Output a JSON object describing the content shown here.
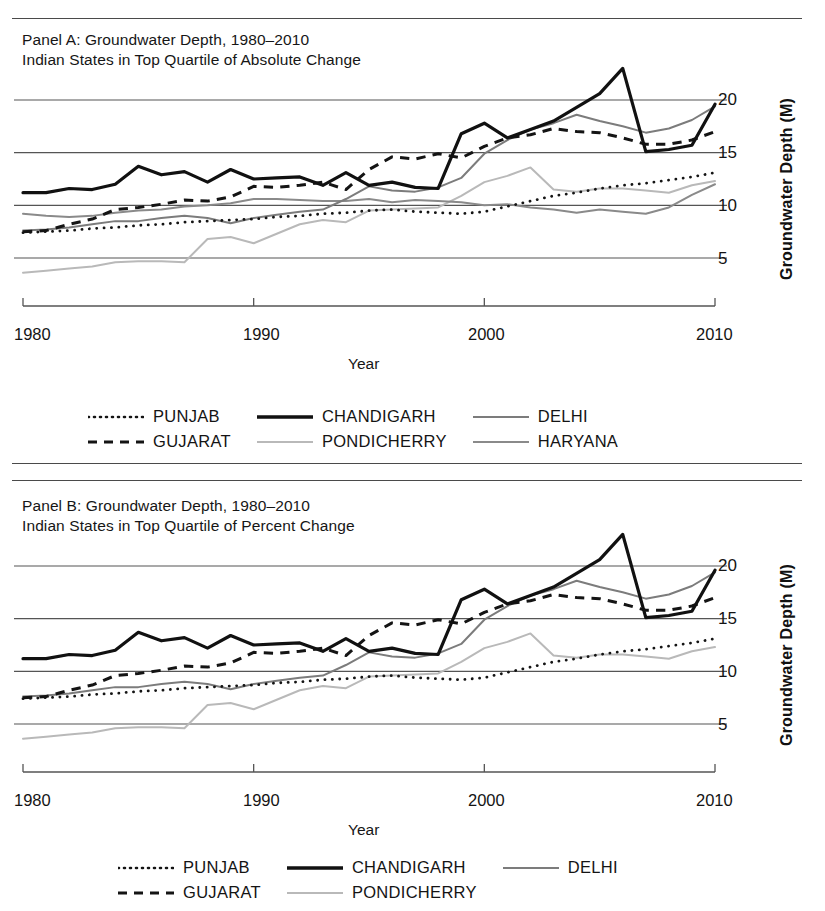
{
  "figure": {
    "ylabel": "Groundwater Depth (M)",
    "xlabel": "Year",
    "xticks": [
      "1980",
      "1990",
      "2000",
      "2010"
    ],
    "yticks": [
      "5",
      "10",
      "15",
      "20"
    ]
  },
  "panels": [
    {
      "id": "panel-a",
      "title_line1": "Panel A: Groundwater Depth, 1980–2010",
      "title_line2": "Indian States in Top Quartile of Absolute Change",
      "ylabel": "Groundwater Depth (M)",
      "xlabel": "Year",
      "legend": [
        {
          "label": "PUNJAB",
          "style": "dotted",
          "color": "#141414",
          "width": 2.6
        },
        {
          "label": "GUJARAT",
          "style": "dashed",
          "color": "#141414",
          "width": 3.0
        },
        {
          "label": "CHANDIGARH",
          "style": "solid",
          "color": "#111111",
          "width": 3.2
        },
        {
          "label": "PONDICHERRY",
          "style": "solid",
          "color": "#b9b9b9",
          "width": 1.9
        },
        {
          "label": "DELHI",
          "style": "solid",
          "color": "#7c7c7c",
          "width": 2.0
        },
        {
          "label": "HARYANA",
          "style": "solid",
          "color": "#8a8a8a",
          "width": 2.0
        }
      ]
    },
    {
      "id": "panel-b",
      "title_line1": "Panel B: Groundwater Depth, 1980–2010",
      "title_line2": "Indian States in Top Quartile of Percent Change",
      "ylabel": "Groundwater Depth (M)",
      "xlabel": "Year",
      "legend": [
        {
          "label": "PUNJAB",
          "style": "dotted",
          "color": "#141414",
          "width": 2.6
        },
        {
          "label": "GUJARAT",
          "style": "dashed",
          "color": "#141414",
          "width": 3.0
        },
        {
          "label": "CHANDIGARH",
          "style": "solid",
          "color": "#111111",
          "width": 3.2
        },
        {
          "label": "PONDICHERRY",
          "style": "solid",
          "color": "#b9b9b9",
          "width": 1.9
        },
        {
          "label": "DELHI",
          "style": "solid",
          "color": "#7c7c7c",
          "width": 2.0
        }
      ]
    }
  ],
  "chart_data": [
    {
      "type": "line",
      "panel": "A",
      "title": "Panel A: Groundwater Depth, 1980–2010 — Indian States in Top Quartile of Absolute Change",
      "xlabel": "Year",
      "ylabel": "Groundwater Depth (M)",
      "xlim": [
        1980,
        2010
      ],
      "ylim": [
        2.5,
        23.5
      ],
      "xticks": [
        1980,
        1990,
        2000,
        2010
      ],
      "yticks": [
        5,
        10,
        15,
        20
      ],
      "grid": "horizontal",
      "legend_position": "below",
      "x": [
        1980,
        1981,
        1982,
        1983,
        1984,
        1985,
        1986,
        1987,
        1988,
        1989,
        1990,
        1991,
        1992,
        1993,
        1994,
        1995,
        1996,
        1997,
        1998,
        1999,
        2000,
        2001,
        2002,
        2003,
        2004,
        2005,
        2006,
        2007,
        2008,
        2009,
        2010
      ],
      "series": [
        {
          "name": "CHANDIGARH",
          "style": "solid",
          "color": "#111111",
          "values": [
            11.2,
            11.2,
            11.6,
            11.5,
            12.0,
            13.7,
            12.9,
            13.2,
            12.2,
            13.4,
            12.5,
            12.6,
            12.7,
            11.9,
            13.1,
            11.9,
            12.2,
            11.7,
            11.6,
            16.8,
            17.8,
            16.4,
            17.2,
            18.0,
            19.3,
            20.6,
            23.0,
            15.1,
            15.3,
            15.7,
            19.6
          ]
        },
        {
          "name": "GUJARAT",
          "style": "dashed",
          "color": "#141414",
          "values": [
            7.5,
            7.6,
            8.2,
            8.7,
            9.6,
            9.8,
            10.1,
            10.5,
            10.4,
            10.8,
            11.8,
            11.7,
            11.9,
            12.2,
            11.5,
            13.4,
            14.6,
            14.4,
            14.9,
            14.5,
            15.6,
            16.4,
            16.7,
            17.3,
            17.0,
            16.9,
            16.4,
            15.8,
            15.8,
            16.2,
            17.0
          ]
        },
        {
          "name": "DELHI",
          "style": "solid",
          "color": "#7c7c7c",
          "values": [
            7.6,
            7.7,
            7.9,
            8.2,
            8.5,
            8.5,
            8.8,
            9.0,
            8.8,
            8.3,
            8.8,
            9.1,
            9.4,
            9.6,
            10.6,
            11.8,
            11.4,
            11.3,
            11.7,
            12.6,
            14.9,
            16.2,
            17.2,
            17.8,
            18.6,
            18.0,
            17.5,
            16.9,
            17.3,
            18.1,
            19.4
          ]
        },
        {
          "name": "PUNJAB",
          "style": "dotted",
          "color": "#141414",
          "values": [
            7.4,
            7.5,
            7.6,
            7.8,
            7.9,
            8.1,
            8.2,
            8.4,
            8.5,
            8.6,
            8.7,
            8.9,
            9.0,
            9.2,
            9.3,
            9.5,
            9.6,
            9.4,
            9.3,
            9.2,
            9.4,
            9.9,
            10.4,
            10.9,
            11.2,
            11.6,
            11.9,
            12.1,
            12.4,
            12.7,
            13.1
          ]
        },
        {
          "name": "HARYANA",
          "style": "solid",
          "color": "#8a8a8a",
          "values": [
            9.2,
            9.0,
            8.9,
            9.0,
            9.3,
            9.5,
            9.6,
            9.9,
            10.0,
            10.2,
            10.6,
            10.6,
            10.5,
            10.4,
            10.4,
            10.6,
            10.3,
            10.5,
            10.4,
            10.3,
            10.0,
            10.1,
            9.8,
            9.6,
            9.3,
            9.6,
            9.4,
            9.2,
            9.8,
            11.0,
            12.0
          ]
        },
        {
          "name": "PONDICHERRY",
          "style": "solid",
          "color": "#b9b9b9",
          "values": [
            3.6,
            3.8,
            4.0,
            4.2,
            4.6,
            4.7,
            4.7,
            4.6,
            6.8,
            7.0,
            6.4,
            7.3,
            8.2,
            8.6,
            8.4,
            9.5,
            9.6,
            9.7,
            9.8,
            10.9,
            12.2,
            12.8,
            13.6,
            11.5,
            11.3,
            11.6,
            11.6,
            11.4,
            11.2,
            11.9,
            12.3
          ]
        }
      ]
    },
    {
      "type": "line",
      "panel": "B",
      "title": "Panel B: Groundwater Depth, 1980–2010 — Indian States in Top Quartile of Percent Change",
      "xlabel": "Year",
      "ylabel": "Groundwater Depth (M)",
      "xlim": [
        1980,
        2010
      ],
      "ylim": [
        2.5,
        23.5
      ],
      "xticks": [
        1980,
        1990,
        2000,
        2010
      ],
      "yticks": [
        5,
        10,
        15,
        20
      ],
      "grid": "horizontal",
      "legend_position": "below",
      "x": [
        1980,
        1981,
        1982,
        1983,
        1984,
        1985,
        1986,
        1987,
        1988,
        1989,
        1990,
        1991,
        1992,
        1993,
        1994,
        1995,
        1996,
        1997,
        1998,
        1999,
        2000,
        2001,
        2002,
        2003,
        2004,
        2005,
        2006,
        2007,
        2008,
        2009,
        2010
      ],
      "series": [
        {
          "name": "CHANDIGARH",
          "style": "solid",
          "color": "#111111",
          "values": [
            11.2,
            11.2,
            11.6,
            11.5,
            12.0,
            13.7,
            12.9,
            13.2,
            12.2,
            13.4,
            12.5,
            12.6,
            12.7,
            11.9,
            13.1,
            11.9,
            12.2,
            11.7,
            11.6,
            16.8,
            17.8,
            16.4,
            17.2,
            18.0,
            19.3,
            20.6,
            23.0,
            15.1,
            15.3,
            15.7,
            19.6
          ]
        },
        {
          "name": "GUJARAT",
          "style": "dashed",
          "color": "#141414",
          "values": [
            7.5,
            7.6,
            8.2,
            8.7,
            9.6,
            9.8,
            10.1,
            10.5,
            10.4,
            10.8,
            11.8,
            11.7,
            11.9,
            12.2,
            11.5,
            13.4,
            14.6,
            14.4,
            14.9,
            14.5,
            15.6,
            16.4,
            16.7,
            17.3,
            17.0,
            16.9,
            16.4,
            15.8,
            15.8,
            16.2,
            17.0
          ]
        },
        {
          "name": "DELHI",
          "style": "solid",
          "color": "#7c7c7c",
          "values": [
            7.6,
            7.7,
            7.9,
            8.2,
            8.5,
            8.5,
            8.8,
            9.0,
            8.8,
            8.3,
            8.8,
            9.1,
            9.4,
            9.6,
            10.6,
            11.8,
            11.4,
            11.3,
            11.7,
            12.6,
            14.9,
            16.2,
            17.2,
            17.8,
            18.6,
            18.0,
            17.5,
            16.9,
            17.3,
            18.1,
            19.4
          ]
        },
        {
          "name": "PUNJAB",
          "style": "dotted",
          "color": "#141414",
          "values": [
            7.4,
            7.5,
            7.6,
            7.8,
            7.9,
            8.1,
            8.2,
            8.4,
            8.5,
            8.6,
            8.7,
            8.9,
            9.0,
            9.2,
            9.3,
            9.5,
            9.6,
            9.4,
            9.3,
            9.2,
            9.4,
            9.9,
            10.4,
            10.9,
            11.2,
            11.6,
            11.9,
            12.1,
            12.4,
            12.7,
            13.1
          ]
        },
        {
          "name": "PONDICHERRY",
          "style": "solid",
          "color": "#b9b9b9",
          "values": [
            3.6,
            3.8,
            4.0,
            4.2,
            4.6,
            4.7,
            4.7,
            4.6,
            6.8,
            7.0,
            6.4,
            7.3,
            8.2,
            8.6,
            8.4,
            9.5,
            9.6,
            9.7,
            9.8,
            10.9,
            12.2,
            12.8,
            13.6,
            11.5,
            11.3,
            11.6,
            11.6,
            11.4,
            11.2,
            11.9,
            12.3
          ]
        }
      ]
    }
  ]
}
